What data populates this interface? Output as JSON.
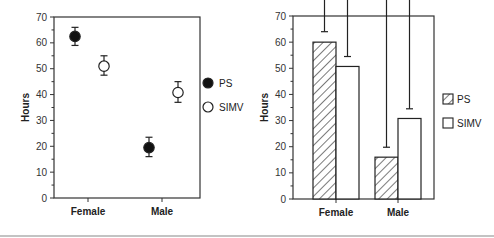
{
  "chart_data": [
    {
      "type": "scatter",
      "title": "",
      "xlabel": "",
      "ylabel": "Hours",
      "ylim": [
        0,
        70
      ],
      "yticks": [
        0,
        10,
        20,
        30,
        40,
        50,
        60,
        70
      ],
      "grid": false,
      "categories": [
        "Female",
        "Male"
      ],
      "legend_position": "right",
      "series": [
        {
          "name": "PS",
          "marker": "filled-circle",
          "values": [
            62.5,
            19.5
          ],
          "err_low": [
            59,
            16
          ],
          "err_high": [
            66,
            23.5
          ]
        },
        {
          "name": "SIMV",
          "marker": "open-circle",
          "values": [
            51,
            40.8
          ],
          "err_low": [
            47.5,
            37
          ],
          "err_high": [
            55,
            45
          ]
        }
      ]
    },
    {
      "type": "bar",
      "title": "",
      "xlabel": "",
      "ylabel": "Hours",
      "ylim": [
        0,
        70
      ],
      "yticks": [
        0,
        10,
        20,
        30,
        40,
        50,
        60,
        70
      ],
      "grid": false,
      "categories": [
        "Female",
        "Male"
      ],
      "legend_position": "right",
      "series": [
        {
          "name": "PS",
          "fill": "hatched",
          "values": [
            60,
            16
          ],
          "err_high": [
            64,
            19.8
          ]
        },
        {
          "name": "SIMV",
          "fill": "open",
          "values": [
            50.7,
            30.8
          ],
          "err_high": [
            54.5,
            34.5
          ]
        }
      ]
    }
  ]
}
